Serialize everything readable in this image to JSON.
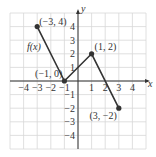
{
  "chart_data": {
    "type": "line",
    "title": "",
    "xlabel": "x",
    "ylabel": "y",
    "function_label": "f(x)",
    "xlim": [
      -5,
      5
    ],
    "ylim": [
      -5,
      5
    ],
    "grid": true,
    "x_ticks": [
      -4,
      -3,
      -2,
      -1,
      1,
      2,
      3,
      4
    ],
    "y_ticks": [
      4,
      3,
      2,
      1,
      -1,
      -2,
      -3,
      -4
    ],
    "x_tick_labels": [
      "−4",
      "−3",
      "−2",
      "−1",
      "1",
      "2",
      "3",
      "4"
    ],
    "y_tick_labels": [
      "4",
      "3",
      "2",
      "1",
      "−1",
      "−2",
      "−3",
      "−4"
    ],
    "series": [
      {
        "name": "f(x)",
        "x": [
          -3,
          -1,
          1,
          3
        ],
        "y": [
          4,
          0,
          2,
          -2
        ]
      }
    ],
    "annotations": [
      {
        "text": "(−3, 4)",
        "x": -3,
        "y": 4
      },
      {
        "text": "(−1, 0)",
        "x": -1,
        "y": 0
      },
      {
        "text": "(1, 2)",
        "x": 1,
        "y": 2
      },
      {
        "text": "(3, −2)",
        "x": 3,
        "y": -2
      }
    ],
    "colors": {
      "line": "#333333",
      "grid": "#d8d8d8",
      "axis": "#333333"
    }
  }
}
